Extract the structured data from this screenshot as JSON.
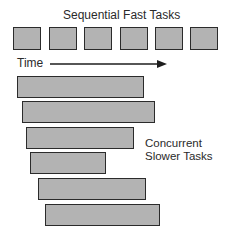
{
  "diagram": {
    "sequential_label": "Sequential Fast Tasks",
    "time_label": "Time",
    "concurrent_label_line1": "Concurrent",
    "concurrent_label_line2": "Slower Tasks",
    "colors": {
      "box_fill": "#b3b3b3",
      "box_border": "#2b2b2b",
      "text": "#2a2a2a"
    },
    "sequential_task_count": 6,
    "concurrent_task_count": 6
  }
}
